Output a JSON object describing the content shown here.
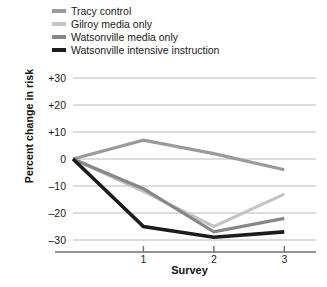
{
  "chart_data": {
    "type": "line",
    "title": "",
    "xlabel": "Survey",
    "ylabel": "Percent change in risk",
    "x": [
      0,
      1,
      2,
      3
    ],
    "xtick_labels": [
      "1",
      "2",
      "3"
    ],
    "xtick_values": [
      1,
      2,
      3
    ],
    "xlim": [
      0,
      3.45
    ],
    "ylim": [
      -34,
      32
    ],
    "ytick_labels": [
      "+30",
      "+20",
      "+10",
      "0",
      "–10",
      "–20",
      "–30"
    ],
    "ytick_values": [
      30,
      20,
      10,
      0,
      -10,
      -20,
      -30
    ],
    "grid": true,
    "legend_position": "top-left",
    "series": [
      {
        "name": "Tracy control",
        "color": "#9a9a9a",
        "width": 3.2,
        "values": [
          0,
          7,
          2,
          -4
        ]
      },
      {
        "name": "Gilroy media only",
        "color": "#c4c4c4",
        "width": 3.2,
        "values": [
          0,
          -12,
          -25,
          -13
        ]
      },
      {
        "name": "Watsonville media only",
        "color": "#878787",
        "width": 3.2,
        "values": [
          0,
          -11,
          -27,
          -22
        ]
      },
      {
        "name": "Watsonville intensive instruction",
        "color": "#1c1c1c",
        "width": 3.6,
        "values": [
          0,
          -25,
          -29,
          -27
        ]
      }
    ]
  },
  "legend": {
    "items": [
      {
        "label": "Tracy control",
        "color": "#9a9a9a"
      },
      {
        "label": "Gilroy media only",
        "color": "#c4c4c4"
      },
      {
        "label": "Watsonville media only",
        "color": "#878787"
      },
      {
        "label": "Watsonville intensive instruction",
        "color": "#1c1c1c"
      }
    ]
  },
  "axes": {
    "y_title": "Percent change in risk",
    "x_title": "Survey"
  },
  "colors": {
    "gridline": "#b9b9b9",
    "axis": "#6f6f6f",
    "text": "#1a1a1a",
    "background": "#ffffff"
  }
}
